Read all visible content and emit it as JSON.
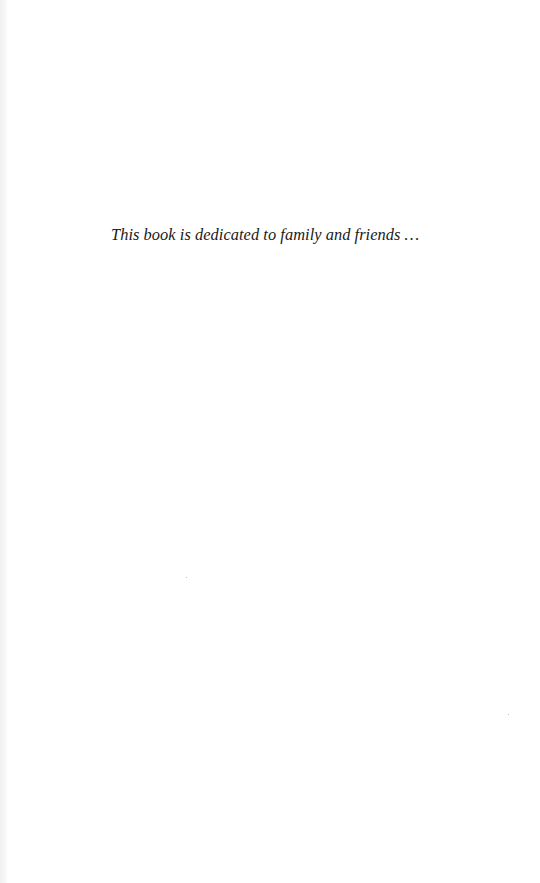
{
  "page": {
    "type": "dedication",
    "dedication_text": "This book is dedicated to family and friends …"
  },
  "colors": {
    "background": "#ffffff",
    "text": "#1a1a1a",
    "gutter": "#f1f1f1"
  }
}
